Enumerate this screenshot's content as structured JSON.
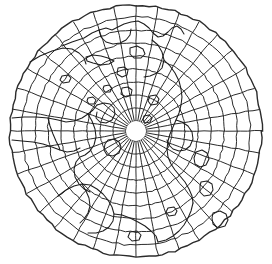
{
  "figure": {
    "type": "map-projection",
    "projection_name": "azimuthal-polar",
    "background_color": "#ffffff",
    "line_color": "#2b2b2b",
    "coastline_color": "#1d1d1d"
  },
  "canvas": {
    "width": 272,
    "height": 264
  },
  "projection": {
    "center_x": 136,
    "center_y": 131,
    "outer_radius": 126,
    "pole_hole_radius": 10,
    "meridian_count": 36,
    "meridian_step_degrees": 10,
    "parallel_count": 10,
    "parallel_radii": [
      10,
      23,
      36,
      49,
      62,
      75,
      88,
      101,
      114,
      126
    ],
    "parallel_labels_degrees": [
      80,
      70,
      60,
      50,
      40,
      30,
      20,
      10,
      0,
      -10
    ],
    "grid_visible": true,
    "graticule_distortion": 0.018
  },
  "coastlines": [
    {
      "name": "northern-landmass-upper",
      "points": [
        [
          62,
          46
        ],
        [
          72,
          42
        ],
        [
          84,
          38
        ],
        [
          92,
          33
        ],
        [
          99,
          30
        ],
        [
          106,
          28
        ],
        [
          112,
          30
        ],
        [
          118,
          27
        ],
        [
          124,
          24
        ],
        [
          131,
          22
        ],
        [
          138,
          21
        ],
        [
          144,
          24
        ],
        [
          149,
          28
        ],
        [
          153,
          33
        ],
        [
          158,
          37
        ],
        [
          163,
          36
        ],
        [
          168,
          32
        ],
        [
          172,
          28
        ],
        [
          177,
          26
        ],
        [
          181,
          29
        ],
        [
          184,
          34
        ]
      ]
    },
    {
      "name": "northern-inlet-a",
      "points": [
        [
          99,
          30
        ],
        [
          101,
          37
        ],
        [
          106,
          42
        ],
        [
          113,
          44
        ],
        [
          120,
          43
        ],
        [
          126,
          40
        ],
        [
          130,
          35
        ],
        [
          131,
          29
        ]
      ]
    },
    {
      "name": "island-chain-north",
      "points": [
        [
          86,
          57
        ],
        [
          93,
          55
        ],
        [
          101,
          56
        ],
        [
          108,
          58
        ],
        [
          114,
          61
        ],
        [
          109,
          64
        ],
        [
          101,
          65
        ],
        [
          93,
          63
        ],
        [
          87,
          61
        ],
        [
          86,
          57
        ]
      ]
    },
    {
      "name": "island-north-small",
      "points": [
        [
          130,
          48
        ],
        [
          137,
          46
        ],
        [
          143,
          49
        ],
        [
          145,
          54
        ],
        [
          141,
          58
        ],
        [
          134,
          58
        ],
        [
          130,
          54
        ],
        [
          130,
          48
        ]
      ]
    },
    {
      "name": "peninsula-upper-right",
      "points": [
        [
          152,
          40
        ],
        [
          158,
          45
        ],
        [
          162,
          52
        ],
        [
          164,
          60
        ],
        [
          162,
          68
        ],
        [
          157,
          73
        ],
        [
          150,
          76
        ],
        [
          144,
          77
        ]
      ]
    },
    {
      "name": "arc-landmass-upper-left",
      "points": [
        [
          30,
          62
        ],
        [
          40,
          56
        ],
        [
          52,
          51
        ],
        [
          63,
          48
        ],
        [
          72,
          49
        ],
        [
          79,
          53
        ],
        [
          84,
          58
        ],
        [
          86,
          64
        ]
      ]
    },
    {
      "name": "coast-left-mid",
      "points": [
        [
          12,
          118
        ],
        [
          24,
          117
        ],
        [
          36,
          117
        ],
        [
          48,
          118
        ],
        [
          58,
          120
        ],
        [
          66,
          122
        ],
        [
          74,
          121
        ],
        [
          82,
          118
        ],
        [
          88,
          114
        ],
        [
          93,
          110
        ],
        [
          97,
          105
        ]
      ]
    },
    {
      "name": "coast-left-lower",
      "points": [
        [
          12,
          140
        ],
        [
          22,
          141
        ],
        [
          33,
          142
        ],
        [
          43,
          144
        ],
        [
          52,
          147
        ],
        [
          60,
          150
        ],
        [
          67,
          152
        ],
        [
          74,
          151
        ],
        [
          80,
          148
        ]
      ]
    },
    {
      "name": "inland-feature-left",
      "points": [
        [
          48,
          118
        ],
        [
          50,
          126
        ],
        [
          53,
          134
        ],
        [
          56,
          141
        ],
        [
          59,
          147
        ],
        [
          60,
          150
        ]
      ]
    },
    {
      "name": "central-west-landmass",
      "points": [
        [
          88,
          114
        ],
        [
          92,
          121
        ],
        [
          95,
          129
        ],
        [
          96,
          137
        ],
        [
          94,
          145
        ],
        [
          90,
          151
        ],
        [
          85,
          155
        ],
        [
          80,
          157
        ],
        [
          76,
          162
        ],
        [
          74,
          169
        ],
        [
          75,
          177
        ],
        [
          79,
          184
        ],
        [
          84,
          189
        ],
        [
          90,
          192
        ]
      ]
    },
    {
      "name": "central-west-inner",
      "points": [
        [
          97,
          105
        ],
        [
          104,
          103
        ],
        [
          110,
          104
        ],
        [
          114,
          108
        ],
        [
          115,
          114
        ],
        [
          112,
          120
        ],
        [
          106,
          123
        ],
        [
          100,
          122
        ],
        [
          96,
          118
        ],
        [
          97,
          112
        ]
      ]
    },
    {
      "name": "central-peninsula-mid",
      "points": [
        [
          108,
          140
        ],
        [
          114,
          139
        ],
        [
          119,
          142
        ],
        [
          121,
          147
        ],
        [
          119,
          153
        ],
        [
          113,
          156
        ],
        [
          107,
          155
        ],
        [
          104,
          150
        ],
        [
          105,
          144
        ],
        [
          108,
          140
        ]
      ]
    },
    {
      "name": "southwest-landmass",
      "points": [
        [
          58,
          196
        ],
        [
          66,
          190
        ],
        [
          74,
          186
        ],
        [
          82,
          184
        ],
        [
          90,
          185
        ],
        [
          97,
          189
        ],
        [
          103,
          194
        ],
        [
          108,
          200
        ],
        [
          112,
          207
        ],
        [
          114,
          214
        ],
        [
          113,
          221
        ],
        [
          109,
          227
        ],
        [
          103,
          231
        ],
        [
          96,
          233
        ],
        [
          88,
          233
        ]
      ]
    },
    {
      "name": "southwest-interior",
      "points": [
        [
          82,
          184
        ],
        [
          86,
          191
        ],
        [
          89,
          198
        ],
        [
          90,
          206
        ],
        [
          88,
          213
        ],
        [
          84,
          219
        ],
        [
          80,
          223
        ]
      ]
    },
    {
      "name": "south-central-coast",
      "points": [
        [
          114,
          214
        ],
        [
          122,
          215
        ],
        [
          130,
          218
        ],
        [
          138,
          222
        ],
        [
          145,
          226
        ],
        [
          151,
          231
        ],
        [
          156,
          236
        ],
        [
          158,
          242
        ]
      ]
    },
    {
      "name": "southeast-coast",
      "points": [
        [
          158,
          242
        ],
        [
          166,
          240
        ],
        [
          173,
          236
        ],
        [
          179,
          231
        ],
        [
          184,
          225
        ],
        [
          188,
          218
        ],
        [
          191,
          211
        ],
        [
          193,
          203
        ]
      ]
    },
    {
      "name": "east-coast-main",
      "points": [
        [
          164,
          60
        ],
        [
          170,
          66
        ],
        [
          175,
          73
        ],
        [
          179,
          81
        ],
        [
          181,
          89
        ],
        [
          182,
          97
        ],
        [
          181,
          105
        ],
        [
          179,
          113
        ],
        [
          176,
          120
        ],
        [
          173,
          127
        ],
        [
          170,
          134
        ],
        [
          168,
          141
        ],
        [
          167,
          149
        ],
        [
          168,
          157
        ],
        [
          171,
          164
        ],
        [
          175,
          170
        ],
        [
          180,
          176
        ],
        [
          185,
          182
        ],
        [
          189,
          189
        ],
        [
          192,
          196
        ],
        [
          193,
          203
        ]
      ]
    },
    {
      "name": "east-inner-feature",
      "points": [
        [
          176,
          120
        ],
        [
          182,
          122
        ],
        [
          188,
          126
        ],
        [
          192,
          132
        ],
        [
          193,
          139
        ],
        [
          190,
          146
        ],
        [
          185,
          150
        ],
        [
          179,
          151
        ],
        [
          173,
          149
        ],
        [
          169,
          145
        ],
        [
          167,
          140
        ]
      ]
    },
    {
      "name": "east-island-a",
      "points": [
        [
          196,
          152
        ],
        [
          202,
          150
        ],
        [
          207,
          153
        ],
        [
          209,
          159
        ],
        [
          206,
          165
        ],
        [
          200,
          167
        ],
        [
          195,
          164
        ],
        [
          194,
          158
        ],
        [
          196,
          152
        ]
      ]
    },
    {
      "name": "east-island-b",
      "points": [
        [
          201,
          182
        ],
        [
          207,
          181
        ],
        [
          212,
          184
        ],
        [
          213,
          190
        ],
        [
          210,
          195
        ],
        [
          204,
          196
        ],
        [
          200,
          192
        ],
        [
          200,
          186
        ],
        [
          201,
          182
        ]
      ]
    },
    {
      "name": "southeast-island",
      "points": [
        [
          213,
          213
        ],
        [
          220,
          211
        ],
        [
          226,
          214
        ],
        [
          228,
          220
        ],
        [
          225,
          226
        ],
        [
          218,
          228
        ],
        [
          213,
          224
        ],
        [
          212,
          218
        ],
        [
          213,
          213
        ]
      ]
    },
    {
      "name": "island-small-center-north",
      "points": [
        [
          118,
          68
        ],
        [
          124,
          67
        ],
        [
          128,
          70
        ],
        [
          127,
          75
        ],
        [
          122,
          77
        ],
        [
          117,
          74
        ],
        [
          118,
          68
        ]
      ]
    },
    {
      "name": "island-small-center",
      "points": [
        [
          122,
          88
        ],
        [
          128,
          87
        ],
        [
          132,
          90
        ],
        [
          131,
          95
        ],
        [
          126,
          97
        ],
        [
          121,
          94
        ],
        [
          122,
          88
        ]
      ]
    },
    {
      "name": "island-tiny-a",
      "points": [
        [
          104,
          86
        ],
        [
          109,
          85
        ],
        [
          112,
          88
        ],
        [
          110,
          92
        ],
        [
          105,
          92
        ],
        [
          103,
          89
        ],
        [
          104,
          86
        ]
      ]
    },
    {
      "name": "island-tiny-b",
      "points": [
        [
          88,
          98
        ],
        [
          93,
          97
        ],
        [
          96,
          100
        ],
        [
          94,
          104
        ],
        [
          89,
          104
        ],
        [
          87,
          101
        ],
        [
          88,
          98
        ]
      ]
    },
    {
      "name": "island-tiny-c",
      "points": [
        [
          150,
          96
        ],
        [
          156,
          95
        ],
        [
          159,
          99
        ],
        [
          157,
          104
        ],
        [
          151,
          105
        ],
        [
          148,
          101
        ],
        [
          150,
          96
        ]
      ]
    },
    {
      "name": "island-tiny-d",
      "points": [
        [
          144,
          116
        ],
        [
          149,
          115
        ],
        [
          152,
          118
        ],
        [
          150,
          122
        ],
        [
          145,
          123
        ],
        [
          143,
          120
        ],
        [
          144,
          116
        ]
      ]
    },
    {
      "name": "island-tiny-e",
      "points": [
        [
          62,
          76
        ],
        [
          68,
          75
        ],
        [
          71,
          78
        ],
        [
          69,
          82
        ],
        [
          63,
          83
        ],
        [
          60,
          80
        ],
        [
          62,
          76
        ]
      ]
    },
    {
      "name": "island-tiny-f",
      "points": [
        [
          168,
          208
        ],
        [
          174,
          207
        ],
        [
          177,
          211
        ],
        [
          175,
          215
        ],
        [
          169,
          216
        ],
        [
          166,
          212
        ],
        [
          168,
          208
        ]
      ]
    },
    {
      "name": "island-tiny-g",
      "points": [
        [
          130,
          232
        ],
        [
          137,
          231
        ],
        [
          141,
          235
        ],
        [
          139,
          240
        ],
        [
          132,
          241
        ],
        [
          128,
          237
        ],
        [
          130,
          232
        ]
      ]
    }
  ]
}
